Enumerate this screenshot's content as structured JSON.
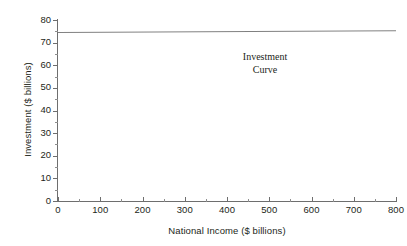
{
  "chart_data": {
    "type": "line",
    "title": "",
    "xlabel": "National Income ($ billions)",
    "ylabel": "Investment ($ billions)",
    "xlim": [
      0,
      800
    ],
    "ylim": [
      0,
      80
    ],
    "grid": false,
    "legend": "none",
    "x_ticks": [
      0,
      100,
      200,
      300,
      400,
      500,
      600,
      700,
      800
    ],
    "x_tick_labels": [
      "0",
      "100",
      "200",
      "300",
      "400",
      "500",
      "600",
      "700",
      "800"
    ],
    "x_minor_ticks": [
      50,
      150,
      250,
      350,
      450,
      550,
      650,
      750
    ],
    "y_ticks": [
      0,
      10,
      20,
      30,
      40,
      50,
      60,
      70,
      80
    ],
    "y_tick_labels": [
      "0",
      "10",
      "20",
      "30",
      "40",
      "50",
      "60",
      "70",
      "80"
    ],
    "y_minor_ticks": [
      5,
      15,
      25,
      35,
      45,
      55,
      65,
      75
    ],
    "series": [
      {
        "name": "Investment Curve",
        "color": "#808080",
        "x": [
          0,
          800
        ],
        "values": [
          74.5,
          75.3
        ]
      }
    ],
    "annotations": [
      {
        "name": "investment-curve-label",
        "line1": "Investment",
        "line2": "Curve",
        "x": 490,
        "y": 63
      }
    ]
  },
  "axes": {
    "y_title": "Investment ($ billions)",
    "x_title": "National Income ($ billions)"
  },
  "colors": {
    "line": "#808080",
    "axis": "#6e6e6e",
    "text": "#231f20",
    "background": "#ffffff"
  }
}
